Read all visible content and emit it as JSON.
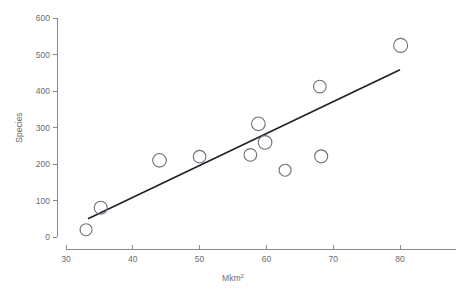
{
  "chart_data": {
    "type": "scatter",
    "title": "",
    "subtitle": "",
    "xlabel": "Mkm2",
    "xlabel_base": "Mkm",
    "xlabel_sup": "2",
    "ylabel": "Species",
    "xlim": [
      28.5,
      84
    ],
    "ylim": [
      0,
      620
    ],
    "xticks": [
      30,
      40,
      50,
      60,
      70,
      80
    ],
    "xtick_labels": [
      "30",
      "40",
      "50",
      "60",
      "70",
      "80"
    ],
    "yticks": [
      0,
      100,
      200,
      300,
      400,
      500,
      600
    ],
    "ytick_labels": [
      "0",
      "100",
      "200",
      "300",
      "400",
      "500",
      "600"
    ],
    "grid": false,
    "legend": null,
    "marker": "open-circle",
    "point_color": "#6e6e78",
    "line_color": "#1f1f28",
    "axis_color": "#8a8a8a",
    "text_color": "#6b6b6b",
    "points": [
      {
        "x": 33.0,
        "y": 20,
        "r": 6.0
      },
      {
        "x": 35.2,
        "y": 80,
        "r": 6.5
      },
      {
        "x": 44.0,
        "y": 210,
        "r": 6.8
      },
      {
        "x": 50.0,
        "y": 220,
        "r": 6.3
      },
      {
        "x": 57.6,
        "y": 225,
        "r": 6.3
      },
      {
        "x": 58.8,
        "y": 310,
        "r": 6.8
      },
      {
        "x": 59.8,
        "y": 259,
        "r": 6.8
      },
      {
        "x": 62.8,
        "y": 183,
        "r": 6.0
      },
      {
        "x": 68.2,
        "y": 221,
        "r": 6.5
      },
      {
        "x": 68.0,
        "y": 412,
        "r": 6.3
      },
      {
        "x": 80.1,
        "y": 525,
        "r": 7.0
      }
    ],
    "fit_line": {
      "type": "linear-regression",
      "x1": 33.3,
      "y1": 50,
      "x2": 80.0,
      "y2": 458
    }
  }
}
